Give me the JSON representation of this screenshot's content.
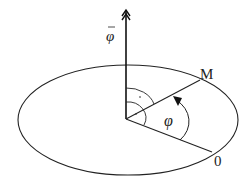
{
  "diagram": {
    "type": "angular-velocity-vector",
    "labels": {
      "vector": "φ",
      "point_m": "M",
      "point_o": "0",
      "angle": "φ"
    },
    "colors": {
      "stroke": "#222222",
      "background": "#ffffff"
    },
    "geometry": {
      "ellipse": {
        "cx": 128,
        "cy": 120,
        "rx": 110,
        "ry": 55
      },
      "origin": [
        126,
        119
      ],
      "vector_tip": [
        126,
        10
      ],
      "point_m": [
        200,
        80
      ],
      "point_o": [
        212,
        152
      ]
    }
  }
}
